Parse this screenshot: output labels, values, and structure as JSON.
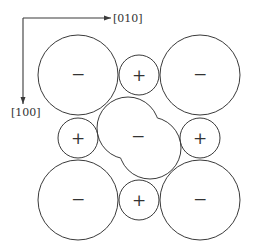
{
  "diagram": {
    "axes": {
      "x_label": "[010]",
      "y_label": "[100]"
    },
    "ions": {
      "anion_sign": "−",
      "cation_sign": "+"
    },
    "large_anions": [
      {
        "id": "top-left",
        "sign": "−"
      },
      {
        "id": "top-right",
        "sign": "−"
      },
      {
        "id": "bottom-left",
        "sign": "−"
      },
      {
        "id": "bottom-right",
        "sign": "−"
      }
    ],
    "small_cations": [
      {
        "id": "top",
        "sign": "+"
      },
      {
        "id": "left",
        "sign": "+"
      },
      {
        "id": "right",
        "sign": "+"
      },
      {
        "id": "bottom",
        "sign": "+"
      }
    ],
    "central_ion": {
      "sign": "−",
      "shape": "two overlapping circles (elongated anion)"
    },
    "colors": {
      "line": "#3a3a3a",
      "background": "#ffffff"
    }
  }
}
